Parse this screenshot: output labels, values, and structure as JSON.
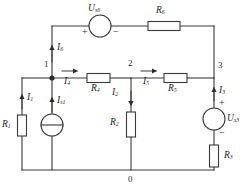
{
  "diagram": {
    "stroke_color": "#3a3a3a",
    "text_color": "#262626"
  },
  "nodes": [
    {
      "name": "node-1",
      "label": "1"
    },
    {
      "name": "node-2",
      "label": "2"
    },
    {
      "name": "node-3",
      "label": "3"
    },
    {
      "name": "node-0",
      "label": "0"
    }
  ],
  "sources": {
    "us6": {
      "symbol": "U",
      "sub": "s6",
      "plus": "+",
      "minus": "−"
    },
    "us3": {
      "symbol": "U",
      "sub": "s3",
      "plus": "+",
      "minus": "−"
    },
    "is1": {
      "symbol": "I",
      "sub": "s1"
    }
  },
  "resistors": [
    {
      "name": "R6",
      "symbol": "R",
      "sub": "6"
    },
    {
      "name": "R1",
      "symbol": "R",
      "sub": "1"
    },
    {
      "name": "R4",
      "symbol": "R",
      "sub": "4"
    },
    {
      "name": "R2",
      "symbol": "R",
      "sub": "2"
    },
    {
      "name": "R5",
      "symbol": "R",
      "sub": "5"
    },
    {
      "name": "R3",
      "symbol": "R",
      "sub": "3"
    }
  ],
  "currents": [
    {
      "name": "I6",
      "symbol": "I",
      "sub": "6"
    },
    {
      "name": "I1",
      "symbol": "I",
      "sub": "1"
    },
    {
      "name": "Is1",
      "symbol": "I",
      "sub": "s1"
    },
    {
      "name": "I4",
      "symbol": "I",
      "sub": "4"
    },
    {
      "name": "I2",
      "symbol": "I",
      "sub": "2"
    },
    {
      "name": "I5",
      "symbol": "I",
      "sub": "5"
    },
    {
      "name": "I3",
      "symbol": "I",
      "sub": "3"
    }
  ]
}
